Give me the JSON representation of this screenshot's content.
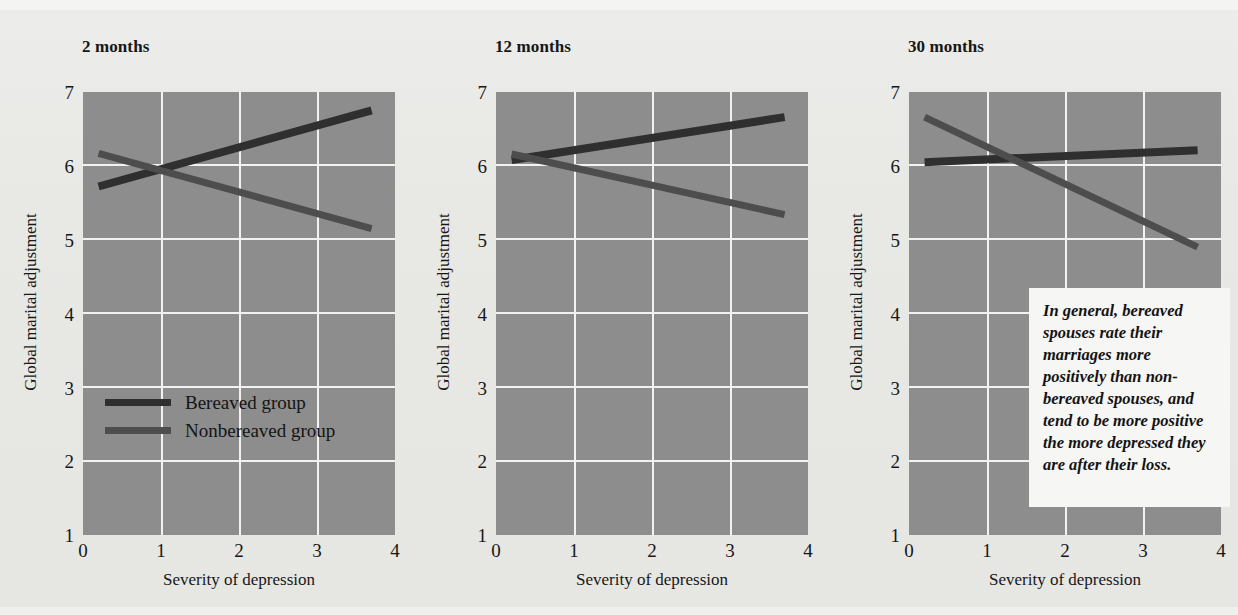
{
  "figure": {
    "background_color": "#e9e9e6",
    "plot_background_color": "#8d8d8d",
    "grid_color": "#f2f2f0"
  },
  "colors": {
    "bereaved": "#2f2f2f",
    "nonbereaved": "#4a4a4a",
    "callout_background": "#f6f6f4"
  },
  "legend": {
    "bereaved_label": "Bereaved group",
    "nonbereaved_label": "Nonbereaved group"
  },
  "callout": {
    "text": "In general, bereaved spouses rate their marriages more positively than non-bereaved spouses, and tend to be more positive the more depressed they are after their loss."
  },
  "axes": {
    "xlabel": "Severity of depression",
    "ylabel": "Global marital adjustment",
    "xticks": [
      "0",
      "1",
      "2",
      "3",
      "4"
    ],
    "yticks": [
      "7",
      "6",
      "5",
      "4",
      "3",
      "2",
      "1"
    ],
    "xlim": [
      0,
      4
    ],
    "ylim": [
      1,
      7
    ]
  },
  "chart_data": {
    "type": "line",
    "title": "",
    "xlabel": "Severity of depression",
    "ylabel": "Global marital adjustment",
    "xlim": [
      0,
      4
    ],
    "ylim": [
      1,
      7
    ],
    "grid": true,
    "legend_position": "inside-lower-left-panel-1",
    "legend": [
      "Bereaved group",
      "Nonbereaved group"
    ],
    "panels": [
      {
        "title": "2 months",
        "series": [
          {
            "name": "Bereaved group",
            "x": [
              0.2,
              3.7
            ],
            "y": [
              5.72,
              6.75
            ]
          },
          {
            "name": "Nonbereaved group",
            "x": [
              0.2,
              3.7
            ],
            "y": [
              6.17,
              5.15
            ]
          }
        ]
      },
      {
        "title": "12 months",
        "series": [
          {
            "name": "Bereaved group",
            "x": [
              0.2,
              3.7
            ],
            "y": [
              6.08,
              6.66
            ]
          },
          {
            "name": "Nonbereaved group",
            "x": [
              0.2,
              3.7
            ],
            "y": [
              6.16,
              5.34
            ]
          }
        ]
      },
      {
        "title": "30 months",
        "series": [
          {
            "name": "Bereaved group",
            "x": [
              0.2,
              3.7
            ],
            "y": [
              6.05,
              6.21
            ]
          },
          {
            "name": "Nonbereaved group",
            "x": [
              0.2,
              3.7
            ],
            "y": [
              6.66,
              4.9
            ]
          }
        ]
      }
    ]
  }
}
